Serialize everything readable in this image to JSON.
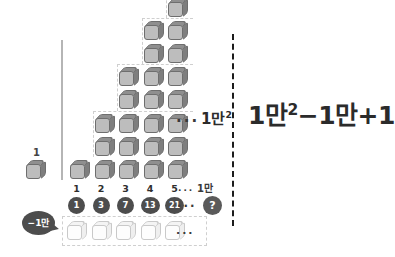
{
  "diagram": {
    "unit_cube_label": "1",
    "columns": [
      {
        "index_label": "1",
        "count_label": "1",
        "height": 1
      },
      {
        "index_label": "2",
        "count_label": "3",
        "height": 3
      },
      {
        "index_label": "3",
        "count_label": "7",
        "height": 5
      },
      {
        "index_label": "4",
        "count_label": "13",
        "height": 7
      },
      {
        "index_label": "5",
        "count_label": "21",
        "height": 9
      }
    ],
    "ellipsis_top": "···",
    "ellipsis_index": "···",
    "ellipsis_chip": "···",
    "ellipsis_ghost": "···",
    "last_index_label": "1만",
    "last_chip_label": "?",
    "stack_total_label": "1만",
    "stack_total_exponent": "2",
    "minus_bubble_label": "−1만",
    "ghost_row_count": 5
  },
  "formula": {
    "term1_base": "1만",
    "term1_exp": "2",
    "minus": "−",
    "term2": "1만",
    "plus": "+",
    "term3": "1"
  },
  "colors": {
    "cube_front": "#bdbdbd",
    "cube_top": "#8f8f8f",
    "cube_side": "#7e7e7e",
    "cube_outline": "#6e6e6e",
    "chip_fill": "#4d4d4d",
    "text": "#2b2b2b",
    "divider": "#1c1c1c",
    "axis_line": "#b5b5b5"
  }
}
